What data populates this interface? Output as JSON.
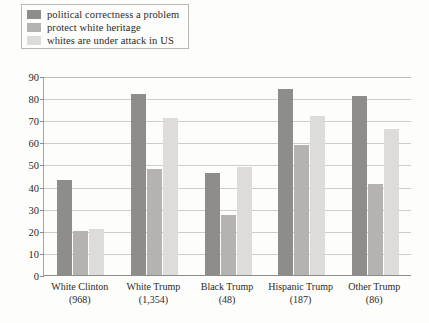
{
  "chart_data": {
    "type": "bar",
    "title": "",
    "subtitle": "",
    "xlabel": "",
    "ylabel": "",
    "ylim": [
      0,
      90
    ],
    "ytick_step": 10,
    "yticks": [
      "0",
      "10",
      "20",
      "30",
      "40",
      "50",
      "60",
      "70",
      "80",
      "90"
    ],
    "grid": true,
    "legend_position": "top-left",
    "categories": [
      "White Clinton",
      "White Trump",
      "Black Trump",
      "Hispanic Trump",
      "Other Trump"
    ],
    "category_counts": [
      "(968)",
      "(1,354)",
      "(48)",
      "(187)",
      "(86)"
    ],
    "series": [
      {
        "name": "political correctness a problem",
        "color": "#8e8d8a",
        "values": [
          43,
          82,
          46,
          84,
          81
        ]
      },
      {
        "name": "protect white heritage",
        "color": "#b4b3b0",
        "values": [
          20,
          48,
          27,
          59,
          41
        ]
      },
      {
        "name": "whites are under attack in US",
        "color": "#dedcd8",
        "values": [
          21,
          71,
          49,
          72,
          66
        ]
      }
    ]
  },
  "legend": {
    "items": [
      {
        "label": "political correctness a problem",
        "color": "#8e8d8a"
      },
      {
        "label": "protect white heritage",
        "color": "#b4b3b0"
      },
      {
        "label": "whites are under attack in US",
        "color": "#dedcd8"
      }
    ]
  },
  "axis": {
    "y_labels": [
      "90",
      "80",
      "70",
      "60",
      "50",
      "40",
      "30",
      "20",
      "10",
      "0"
    ],
    "x_groups": [
      {
        "cat": "White Clinton",
        "n": "(968)"
      },
      {
        "cat": "White Trump",
        "n": "(1,354)"
      },
      {
        "cat": "Black Trump",
        "n": "(48)"
      },
      {
        "cat": "Hispanic Trump",
        "n": "(187)"
      },
      {
        "cat": "Other Trump",
        "n": "(86)"
      }
    ]
  }
}
